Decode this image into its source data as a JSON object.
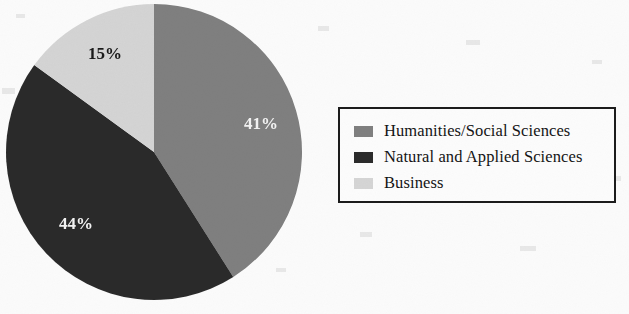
{
  "chart_data": {
    "type": "pie",
    "title": "",
    "subtitle": "",
    "xlabel": "",
    "ylabel": "",
    "grid": false,
    "legend_position": "right",
    "start_angle_deg": 0,
    "direction": "clockwise",
    "categories": [
      "Humanities/Social Sciences",
      "Natural and Applied Sciences",
      "Business"
    ],
    "values": [
      41,
      44,
      15
    ],
    "value_unit": "%",
    "data_labels": [
      "41%",
      "44%",
      "15%"
    ],
    "colors": [
      "#808080",
      "#2b2b2b",
      "#d5d5d5"
    ],
    "label_colors": [
      "#f2f2f2",
      "#f2f2f2",
      "#1a1a1a"
    ],
    "slices": [
      {
        "label": "Humanities/Social Sciences",
        "value": 41,
        "data_label": "41%",
        "color": "#808080",
        "label_color": "#f2f2f2"
      },
      {
        "label": "Natural and Applied Sciences",
        "value": 44,
        "data_label": "44%",
        "color": "#2b2b2b",
        "label_color": "#f2f2f2"
      },
      {
        "label": "Business",
        "value": 15,
        "data_label": "15%",
        "color": "#d5d5d5",
        "label_color": "#1a1a1a"
      }
    ]
  },
  "legend": {
    "items": [
      {
        "label": "Humanities/Social Sciences",
        "color": "#808080"
      },
      {
        "label": "Natural and Applied Sciences",
        "color": "#2b2b2b"
      },
      {
        "label": "Business",
        "color": "#d5d5d5"
      }
    ]
  },
  "colors": {
    "slice_humanities": "#808080",
    "slice_natural_applied": "#2b2b2b",
    "slice_business": "#d5d5d5",
    "legend_border": "#1c1c1c",
    "background": "#fbfbfb",
    "label_on_dark": "#f2f2f2",
    "label_on_light": "#1a1a1a"
  }
}
